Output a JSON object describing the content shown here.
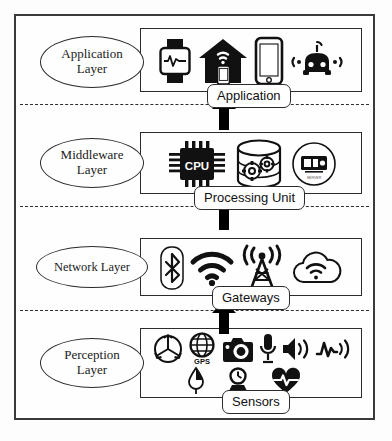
{
  "diagram": {
    "frame_color": "#3a3a3a",
    "accent_color": "#000000",
    "background": "#ffffff"
  },
  "layers": [
    {
      "id": "application",
      "ellipse_lines": [
        "Application",
        "Layer"
      ],
      "sub_label": "Application",
      "icons": [
        {
          "name": "smartwatch-icon",
          "label": "Smartwatch"
        },
        {
          "name": "smart-home-icon",
          "label": "Smart Home"
        },
        {
          "name": "smartphone-icon",
          "label": "Smartphone"
        },
        {
          "name": "connected-car-icon",
          "label": "Connected Car"
        }
      ]
    },
    {
      "id": "middleware",
      "ellipse_lines": [
        "Middleware",
        "Layer"
      ],
      "sub_label": "Processing Unit",
      "icons": [
        {
          "name": "cpu-chip-icon",
          "label": "CPU"
        },
        {
          "name": "database-gears-icon",
          "label": "Data Processing"
        },
        {
          "name": "server-module-icon",
          "label": "Server Module"
        }
      ]
    },
    {
      "id": "network",
      "ellipse_lines": [
        "Network Layer"
      ],
      "sub_label": "Gateways",
      "icons": [
        {
          "name": "bluetooth-icon",
          "label": "Bluetooth"
        },
        {
          "name": "wifi-icon",
          "label": "Wi-Fi"
        },
        {
          "name": "cell-tower-icon",
          "label": "Cellular Tower"
        },
        {
          "name": "cloud-wifi-icon",
          "label": "Cloud"
        }
      ]
    },
    {
      "id": "perception",
      "ellipse_lines": [
        "Perception",
        "Layer"
      ],
      "sub_label": "Sensors",
      "icons_row1": [
        {
          "name": "gyroscope-icon",
          "label": "Gyroscope"
        },
        {
          "name": "gps-globe-icon",
          "label": "GPS"
        },
        {
          "name": "camera-icon",
          "label": "Camera"
        },
        {
          "name": "microphone-icon",
          "label": "Microphone"
        },
        {
          "name": "speaker-icon",
          "label": "Speaker"
        },
        {
          "name": "vibration-signal-icon",
          "label": "Vibration Sensor"
        }
      ],
      "icons_row2": [
        {
          "name": "humidity-drop-icon",
          "label": "Humidity Sensor"
        },
        {
          "name": "pressure-gauge-icon",
          "label": "Pressure Sensor"
        },
        {
          "name": "heart-rate-icon",
          "label": "Heart Rate Sensor"
        }
      ]
    }
  ],
  "gps_caption": "GPS",
  "cpu_caption": "CPU",
  "arrows": [
    {
      "name": "arrow-network-to-middleware",
      "direction": "up"
    },
    {
      "name": "arrow-middleware-to-application",
      "direction": "up"
    },
    {
      "name": "arrow-perception-to-network",
      "direction": "up"
    }
  ]
}
